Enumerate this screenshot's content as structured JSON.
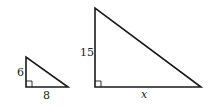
{
  "figure": {
    "small_triangle": {
      "vertical_leg_label": "6",
      "horizontal_leg_label": "8",
      "right_angle_marker": true
    },
    "large_triangle": {
      "vertical_leg_label": "15",
      "horizontal_leg_label": "x",
      "right_angle_marker": true
    },
    "stroke_color": "#1a1a1a"
  }
}
